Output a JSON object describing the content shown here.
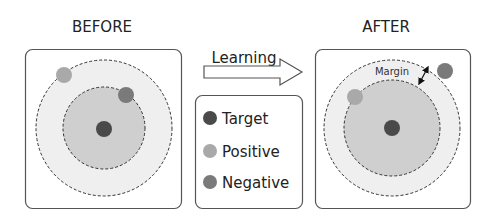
{
  "before": {
    "title": "BEFORE"
  },
  "after": {
    "title": "AFTER",
    "margin_label": "Margin"
  },
  "arrow": {
    "label": "Learning"
  },
  "legend": {
    "items": [
      {
        "label": "Target",
        "color": "#4a4a4a"
      },
      {
        "label": "Positive",
        "color": "#a9a9a9"
      },
      {
        "label": "Negative",
        "color": "#7a7a7a"
      }
    ]
  },
  "colors": {
    "box_border": "#555555",
    "outer_region": "#efefef",
    "inner_region": "#cfcfcf",
    "dashed_line": "#333333",
    "target": "#4a4a4a",
    "positive": "#a9a9a9",
    "negative": "#7a7a7a"
  }
}
